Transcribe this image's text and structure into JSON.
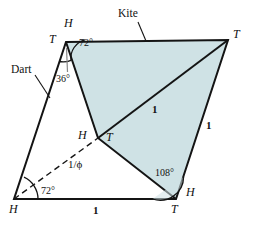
{
  "figure": {
    "fill_color": "#cfe2e5",
    "stroke_color": "#141414",
    "background_color": "#ffffff"
  },
  "shape_names": {
    "kite": "Kite",
    "dart": "Dart"
  },
  "vertex_labels": {
    "top_left_T": "T",
    "top_left_H": "H",
    "top_right_T": "T",
    "center_H": "H",
    "center_T": "T",
    "bottom_left_H": "H",
    "bottom_right_T": "T",
    "bottom_right_H": "H"
  },
  "angles": {
    "top_72": "72°",
    "top_36": "36°",
    "bottom_left_72": "72°",
    "bottom_right_108": "108°"
  },
  "lengths": {
    "diagonal_one": "1",
    "right_edge_one": "1",
    "bottom_edge_one": "1",
    "dashed_inverse_phi": "1/ϕ"
  },
  "geometry": {
    "points": {
      "A_top_left": [
        66,
        42
      ],
      "B_top_right": [
        228,
        40
      ],
      "C_bottom_right": [
        176,
        199
      ],
      "D_bottom_left": [
        14,
        199
      ],
      "E_center": [
        98,
        138
      ]
    },
    "kite_polygon": "66,42 228,40 176,199 98,138",
    "dart_polygon": "66,42 98,138 176,199 14,199"
  }
}
